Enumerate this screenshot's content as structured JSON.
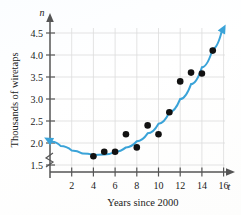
{
  "chart_data": {
    "type": "scatter",
    "title": "",
    "xlabel": "Years since 2000",
    "ylabel": "Thousands of wiretaps",
    "x_var": "t",
    "y_var": "n",
    "xlim": [
      0,
      17
    ],
    "ylim": [
      1.4,
      4.7
    ],
    "grid": true,
    "legend": "none",
    "y_axis_break": true,
    "x_ticks": [
      2,
      4,
      6,
      8,
      10,
      12,
      14,
      16
    ],
    "x_tick_labels": [
      "2",
      "4",
      "6",
      "8",
      "10",
      "12",
      "14",
      "16"
    ],
    "y_ticks": [
      1.5,
      2.0,
      2.5,
      3.0,
      3.5,
      4.0,
      4.5
    ],
    "y_tick_labels": [
      "1.5",
      "2.0",
      "2.5",
      "3.0",
      "3.5",
      "4.0",
      "4.5"
    ],
    "points": [
      {
        "x": 4,
        "y": 1.7
      },
      {
        "x": 5,
        "y": 1.8
      },
      {
        "x": 6,
        "y": 1.8
      },
      {
        "x": 7,
        "y": 2.2
      },
      {
        "x": 8,
        "y": 1.9
      },
      {
        "x": 9,
        "y": 2.4
      },
      {
        "x": 10,
        "y": 2.2
      },
      {
        "x": 11,
        "y": 2.7
      },
      {
        "x": 12,
        "y": 3.4
      },
      {
        "x": 13,
        "y": 3.6
      },
      {
        "x": 14,
        "y": 3.58
      },
      {
        "x": 15,
        "y": 4.1
      }
    ],
    "curve": {
      "kind": "quadratic-fit",
      "color": "#3aa3d8",
      "arrow_start": true,
      "arrow_end": true,
      "samples": [
        {
          "x": 0.2,
          "y": 2.03
        },
        {
          "x": 1.0,
          "y": 1.93
        },
        {
          "x": 2.0,
          "y": 1.83
        },
        {
          "x": 3.0,
          "y": 1.76
        },
        {
          "x": 4.0,
          "y": 1.73
        },
        {
          "x": 5.0,
          "y": 1.74
        },
        {
          "x": 6.0,
          "y": 1.8
        },
        {
          "x": 7.0,
          "y": 1.9
        },
        {
          "x": 8.0,
          "y": 2.04
        },
        {
          "x": 9.0,
          "y": 2.22
        },
        {
          "x": 10.0,
          "y": 2.44
        },
        {
          "x": 11.0,
          "y": 2.7
        },
        {
          "x": 12.0,
          "y": 3.0
        },
        {
          "x": 13.0,
          "y": 3.34
        },
        {
          "x": 14.0,
          "y": 3.72
        },
        {
          "x": 15.0,
          "y": 4.14
        },
        {
          "x": 15.8,
          "y": 4.51
        }
      ]
    },
    "colors": {
      "curve": "#3aa3d8",
      "point": "#111111",
      "grid": "#dcdcdc",
      "axis": "#555555",
      "text": "#1a1a1a"
    }
  }
}
